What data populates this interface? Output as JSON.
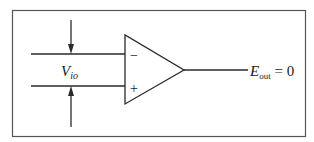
{
  "diagram": {
    "type": "op-amp input offset voltage schematic",
    "input_labels": {
      "inverting": "−",
      "noninverting": "+"
    },
    "voltage_label": {
      "main": "V",
      "subscript": "io"
    },
    "output_label": {
      "main": "E",
      "subscript": "out",
      "suffix": " = 0"
    },
    "colors": {
      "stroke": "#2a2a2a",
      "frame": "#555555",
      "background": "#ffffff"
    }
  }
}
